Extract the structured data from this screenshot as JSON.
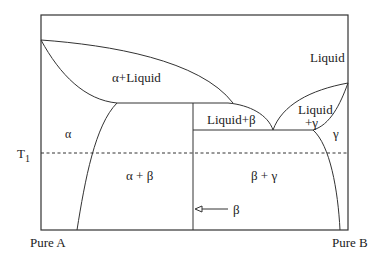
{
  "diagram": {
    "type": "binary phase diagram",
    "axis": {
      "left_label": "Pure A",
      "right_label": "Pure B",
      "temperature_marker": "T",
      "temperature_marker_subscript": "1"
    },
    "regions": {
      "liquid": "Liquid",
      "alpha_liquid": "α+Liquid",
      "liquid_beta": "Liquid+β",
      "liquid_gamma_line1": "Liquid",
      "liquid_gamma_line2": "+γ",
      "alpha": "α",
      "gamma": "γ",
      "alpha_beta": "α + β",
      "beta_gamma": "β + γ"
    },
    "annotations": {
      "beta_phase_arrow_label": "β"
    },
    "colors": {
      "line": "#333333",
      "text": "#222222",
      "background": "#ffffff"
    }
  }
}
